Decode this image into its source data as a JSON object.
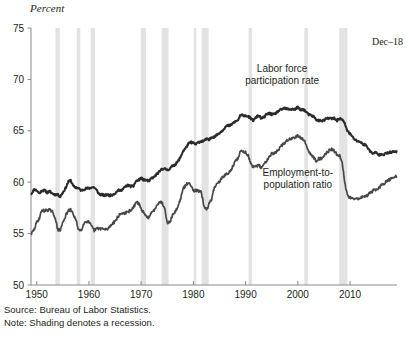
{
  "chart_data": {
    "type": "line",
    "title": "",
    "ylabel": "Percent",
    "xlabel": "",
    "ylim": [
      50,
      75
    ],
    "xlim": [
      1948.9,
      2019.0
    ],
    "yticks": [
      50,
      55,
      60,
      65,
      70,
      75
    ],
    "ytick_labels": [
      "50",
      "55",
      "60",
      "65",
      "70",
      "75"
    ],
    "xticks": [
      1950,
      1960,
      1970,
      1980,
      1990,
      2000,
      2010
    ],
    "xtick_labels": [
      "1950",
      "1960",
      "1970",
      "1980",
      "1990",
      "2000",
      "2010"
    ],
    "grid": false,
    "legend_position": "inline-annotation",
    "annotations": [
      {
        "name": "end-date",
        "text": "Dec–18",
        "x": 2014.2,
        "y": 73.6
      },
      {
        "name": "lfpr-label",
        "text": "Labor force\nparticipation rate",
        "x": 1997.0,
        "y": 70.4
      },
      {
        "name": "epop-label",
        "text": "Employment-to-\npopulation ratio",
        "x": 2000.0,
        "y": 60.3
      }
    ],
    "shaded_bands": {
      "label": "Shading denotes a recession.",
      "color": "#e3e3e3",
      "intervals": [
        [
          1953.58,
          1954.42
        ],
        [
          1957.67,
          1958.33
        ],
        [
          1960.33,
          1961.17
        ],
        [
          1969.92,
          1970.92
        ],
        [
          1973.92,
          1975.25
        ],
        [
          1980.08,
          1980.58
        ],
        [
          1981.58,
          1982.92
        ],
        [
          1990.58,
          1991.25
        ],
        [
          2001.25,
          2001.92
        ],
        [
          2007.92,
          2009.5
        ]
      ]
    },
    "series": [
      {
        "name": "Labor force participation rate",
        "color": "#2b2b2b",
        "line_width": 2.1,
        "x": [
          1949.0,
          1949.5,
          1950.0,
          1950.5,
          1951.0,
          1951.5,
          1952.0,
          1952.5,
          1953.0,
          1953.5,
          1954.0,
          1954.5,
          1955.0,
          1955.5,
          1956.0,
          1956.5,
          1957.0,
          1957.5,
          1958.0,
          1958.5,
          1959.0,
          1959.5,
          1960.0,
          1960.5,
          1961.0,
          1961.5,
          1962.0,
          1962.5,
          1963.0,
          1963.5,
          1964.0,
          1964.5,
          1965.0,
          1965.5,
          1966.0,
          1966.5,
          1967.0,
          1967.5,
          1968.0,
          1968.5,
          1969.0,
          1969.5,
          1970.0,
          1970.5,
          1971.0,
          1971.5,
          1972.0,
          1972.5,
          1973.0,
          1973.5,
          1974.0,
          1974.5,
          1975.0,
          1975.5,
          1976.0,
          1976.5,
          1977.0,
          1977.5,
          1978.0,
          1978.5,
          1979.0,
          1979.5,
          1980.0,
          1980.5,
          1981.0,
          1981.5,
          1982.0,
          1982.5,
          1983.0,
          1983.5,
          1984.0,
          1984.5,
          1985.0,
          1985.5,
          1986.0,
          1986.5,
          1987.0,
          1987.5,
          1988.0,
          1988.5,
          1989.0,
          1989.5,
          1990.0,
          1990.5,
          1991.0,
          1991.5,
          1992.0,
          1992.5,
          1993.0,
          1993.5,
          1994.0,
          1994.5,
          1995.0,
          1995.5,
          1996.0,
          1996.5,
          1997.0,
          1997.5,
          1998.0,
          1998.5,
          1999.0,
          1999.5,
          2000.0,
          2000.5,
          2001.0,
          2001.5,
          2002.0,
          2002.5,
          2003.0,
          2003.5,
          2004.0,
          2004.5,
          2005.0,
          2005.5,
          2006.0,
          2006.5,
          2007.0,
          2007.5,
          2008.0,
          2008.5,
          2009.0,
          2009.5,
          2010.0,
          2010.5,
          2011.0,
          2011.5,
          2012.0,
          2012.5,
          2013.0,
          2013.5,
          2014.0,
          2014.5,
          2015.0,
          2015.5,
          2016.0,
          2016.5,
          2017.0,
          2017.5,
          2018.0,
          2018.5,
          2018.95
        ],
        "y": [
          58.9,
          59.3,
          59.2,
          58.9,
          59.2,
          59.2,
          59.0,
          59.1,
          58.9,
          58.8,
          58.8,
          58.6,
          59.0,
          59.4,
          60.0,
          60.2,
          59.6,
          59.5,
          59.4,
          59.2,
          59.3,
          59.4,
          59.4,
          59.5,
          59.5,
          59.2,
          58.8,
          58.8,
          58.7,
          58.8,
          58.7,
          58.8,
          58.9,
          59.2,
          59.2,
          59.3,
          59.6,
          59.7,
          59.6,
          59.6,
          60.1,
          60.2,
          60.4,
          60.2,
          60.2,
          60.1,
          60.4,
          60.5,
          60.8,
          61.0,
          61.3,
          61.3,
          61.2,
          61.3,
          61.6,
          61.7,
          62.0,
          62.4,
          63.0,
          63.3,
          63.7,
          63.9,
          63.8,
          63.7,
          63.9,
          64.0,
          64.0,
          64.2,
          64.1,
          64.4,
          64.4,
          64.6,
          64.8,
          65.0,
          65.3,
          65.5,
          65.5,
          65.7,
          65.9,
          66.0,
          66.5,
          66.5,
          66.5,
          66.4,
          66.2,
          66.0,
          66.3,
          66.5,
          66.2,
          66.3,
          66.6,
          66.7,
          66.6,
          66.6,
          66.8,
          67.0,
          67.1,
          67.2,
          67.1,
          67.1,
          67.1,
          67.1,
          67.3,
          67.0,
          67.1,
          66.9,
          66.6,
          66.5,
          66.4,
          66.1,
          66.0,
          66.0,
          66.0,
          66.2,
          66.2,
          66.2,
          66.2,
          66.0,
          66.2,
          66.1,
          65.7,
          65.0,
          64.7,
          64.4,
          64.1,
          64.0,
          63.9,
          63.7,
          63.6,
          63.3,
          62.9,
          62.8,
          62.9,
          62.6,
          62.8,
          62.7,
          62.8,
          62.9,
          62.9,
          63.0,
          62.9
        ],
        "noise_seed": 11,
        "noise_amp": 0.1
      },
      {
        "name": "Employment-to-population ratio",
        "color": "#484848",
        "line_width": 1.7,
        "x": [
          1949.0,
          1949.5,
          1950.0,
          1950.5,
          1951.0,
          1951.5,
          1952.0,
          1952.5,
          1953.0,
          1953.5,
          1954.0,
          1954.5,
          1955.0,
          1955.5,
          1956.0,
          1956.5,
          1957.0,
          1957.5,
          1958.0,
          1958.5,
          1959.0,
          1959.5,
          1960.0,
          1960.5,
          1961.0,
          1961.5,
          1962.0,
          1962.5,
          1963.0,
          1963.5,
          1964.0,
          1964.5,
          1965.0,
          1965.5,
          1966.0,
          1966.5,
          1967.0,
          1967.5,
          1968.0,
          1968.5,
          1969.0,
          1969.5,
          1970.0,
          1970.5,
          1971.0,
          1971.5,
          1972.0,
          1972.5,
          1973.0,
          1973.5,
          1974.0,
          1974.5,
          1975.0,
          1975.5,
          1976.0,
          1976.5,
          1977.0,
          1977.5,
          1978.0,
          1978.5,
          1979.0,
          1979.5,
          1980.0,
          1980.5,
          1981.0,
          1981.5,
          1982.0,
          1982.5,
          1983.0,
          1983.5,
          1984.0,
          1984.5,
          1985.0,
          1985.5,
          1986.0,
          1986.5,
          1987.0,
          1987.5,
          1988.0,
          1988.5,
          1989.0,
          1989.5,
          1990.0,
          1990.5,
          1991.0,
          1991.5,
          1992.0,
          1992.5,
          1993.0,
          1993.5,
          1994.0,
          1994.5,
          1995.0,
          1995.5,
          1996.0,
          1996.5,
          1997.0,
          1997.5,
          1998.0,
          1998.5,
          1999.0,
          1999.5,
          2000.0,
          2000.5,
          2001.0,
          2001.5,
          2002.0,
          2002.5,
          2003.0,
          2003.5,
          2004.0,
          2004.5,
          2005.0,
          2005.5,
          2006.0,
          2006.5,
          2007.0,
          2007.5,
          2008.0,
          2008.5,
          2009.0,
          2009.5,
          2010.0,
          2010.5,
          2011.0,
          2011.5,
          2012.0,
          2012.5,
          2013.0,
          2013.5,
          2014.0,
          2014.5,
          2015.0,
          2015.5,
          2016.0,
          2016.5,
          2017.0,
          2017.5,
          2018.0,
          2018.5,
          2018.95
        ],
        "y": [
          55.0,
          55.4,
          56.1,
          56.5,
          57.3,
          57.2,
          57.3,
          57.3,
          57.1,
          56.6,
          55.4,
          55.3,
          56.1,
          56.7,
          57.2,
          57.3,
          56.9,
          56.3,
          55.4,
          55.3,
          56.0,
          56.2,
          56.1,
          55.7,
          55.3,
          55.5,
          55.5,
          55.5,
          55.4,
          55.4,
          55.7,
          56.0,
          56.2,
          56.6,
          56.9,
          57.0,
          57.0,
          57.1,
          57.3,
          57.5,
          58.0,
          58.0,
          57.4,
          57.0,
          56.6,
          56.6,
          57.0,
          57.3,
          57.8,
          58.1,
          58.0,
          57.5,
          56.1,
          56.1,
          56.8,
          57.1,
          57.6,
          58.3,
          59.3,
          59.7,
          59.9,
          59.8,
          59.2,
          59.2,
          59.1,
          59.0,
          57.8,
          57.2,
          57.9,
          58.4,
          59.5,
          59.8,
          60.1,
          60.4,
          60.7,
          60.8,
          61.0,
          61.5,
          62.0,
          62.3,
          63.0,
          63.0,
          62.9,
          62.6,
          61.8,
          61.4,
          61.5,
          61.7,
          61.4,
          61.7,
          62.1,
          62.5,
          62.8,
          62.8,
          63.0,
          63.3,
          63.6,
          63.8,
          64.1,
          64.2,
          64.3,
          64.4,
          64.6,
          64.3,
          64.2,
          63.8,
          63.1,
          62.7,
          62.4,
          62.1,
          62.3,
          62.3,
          62.6,
          62.8,
          63.1,
          63.2,
          63.0,
          62.7,
          62.6,
          61.9,
          60.0,
          58.7,
          58.5,
          58.5,
          58.4,
          58.4,
          58.5,
          58.6,
          58.6,
          58.8,
          59.0,
          59.2,
          59.3,
          59.4,
          59.7,
          59.8,
          60.1,
          60.2,
          60.4,
          60.5,
          60.6
        ],
        "noise_seed": 29,
        "noise_amp": 0.14
      }
    ]
  },
  "footnotes": {
    "source": "Source: Bureau of Labor Statistics.",
    "note": "Note: Shading denotes a recession."
  }
}
